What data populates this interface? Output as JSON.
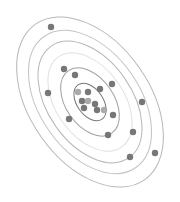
{
  "chart_data": {
    "type": "scatter",
    "title": "",
    "xlabel": "",
    "ylabel": "",
    "grid": false,
    "legend": null,
    "contours": {
      "kind": "concentric confidence ellipses",
      "center": [
        90,
        102
      ],
      "rotation_deg": -35,
      "levels": [
        {
          "rx": 13,
          "ry": 21,
          "color": "#555555",
          "opacity": 0.8
        },
        {
          "rx": 24,
          "ry": 38,
          "color": "#777777",
          "opacity": 0.7
        },
        {
          "rx": 34,
          "ry": 55,
          "color": "#dddddd",
          "opacity": 0.9
        },
        {
          "rx": 42,
          "ry": 68,
          "color": "#999999",
          "opacity": 0.7
        },
        {
          "rx": 50,
          "ry": 80,
          "color": "#aaaaaa",
          "opacity": 0.7
        },
        {
          "rx": 60,
          "ry": 95,
          "color": "#999999",
          "opacity": 0.7
        }
      ]
    },
    "points": [
      {
        "x": 51,
        "y": 27,
        "shade": "#777777"
      },
      {
        "x": 64,
        "y": 69,
        "shade": "#777777"
      },
      {
        "x": 75,
        "y": 75,
        "shade": "#777777"
      },
      {
        "x": 48,
        "y": 93,
        "shade": "#777777"
      },
      {
        "x": 112,
        "y": 84,
        "shade": "#777777"
      },
      {
        "x": 142,
        "y": 102,
        "shade": "#777777"
      },
      {
        "x": 69,
        "y": 119,
        "shade": "#777777"
      },
      {
        "x": 113,
        "y": 115,
        "shade": "#777777"
      },
      {
        "x": 108,
        "y": 135,
        "shade": "#777777"
      },
      {
        "x": 133,
        "y": 132,
        "shade": "#777777"
      },
      {
        "x": 130,
        "y": 157,
        "shade": "#777777"
      },
      {
        "x": 155,
        "y": 153,
        "shade": "#777777"
      },
      {
        "x": 78,
        "y": 92,
        "shade": "#aaaaaa"
      },
      {
        "x": 88,
        "y": 92,
        "shade": "#777777"
      },
      {
        "x": 100,
        "y": 89,
        "shade": "#777777"
      },
      {
        "x": 82,
        "y": 101,
        "shade": "#777777"
      },
      {
        "x": 88,
        "y": 101,
        "shade": "#aaaaaa"
      },
      {
        "x": 84,
        "y": 108,
        "shade": "#777777"
      },
      {
        "x": 95,
        "y": 104,
        "shade": "#777777"
      },
      {
        "x": 97,
        "y": 110,
        "shade": "#777777"
      },
      {
        "x": 104,
        "y": 110,
        "shade": "#aaaaaa"
      }
    ],
    "point_radius": 3.2
  }
}
